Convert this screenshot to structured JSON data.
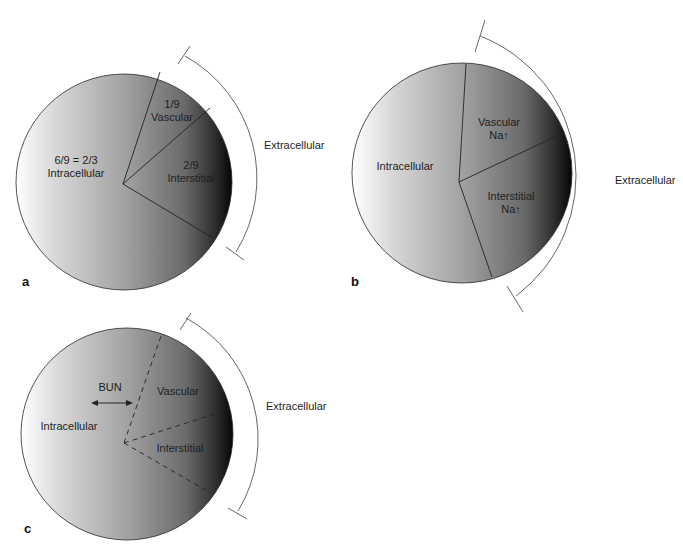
{
  "figure": {
    "panels": [
      {
        "id": "a",
        "letter": "a",
        "labels": {
          "intracellular_fraction": "6/9 = 2/3",
          "intracellular": "Intracellular",
          "vascular_fraction": "1/9",
          "vascular": "Vascular",
          "interstitial_fraction": "2/9",
          "interstitial": "Interstitial",
          "extracellular": "Extracellular"
        },
        "divider_style": "solid"
      },
      {
        "id": "b",
        "letter": "b",
        "labels": {
          "intracellular": "Intracellular",
          "vascular": "Vascular",
          "vascular_na": "Na↑",
          "interstitial": "Interstitial",
          "interstitial_na": "Na↑",
          "extracellular": "Extracellular"
        },
        "divider_style": "solid"
      },
      {
        "id": "c",
        "letter": "c",
        "labels": {
          "bun": "BUN",
          "intracellular": "Intracellular",
          "vascular": "Vascular",
          "interstitial": "Interstitial",
          "extracellular": "Extracellular"
        },
        "divider_style": "dashed",
        "arrow": "double-headed horizontal arrow (BUN moves freely across cell membrane)"
      }
    ],
    "colors": {
      "gradient_light": "#ffffff",
      "gradient_mid": "#9c9c9c",
      "gradient_dark": "#0a0a0a",
      "stroke": "#2a2a2a",
      "bracket": "#555555"
    }
  }
}
